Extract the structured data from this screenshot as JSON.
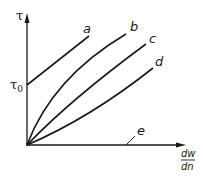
{
  "diagram": {
    "type": "flow-curve-diagram",
    "y_axis": {
      "label": "τ"
    },
    "x_axis": {
      "label_numerator": "dw",
      "label_denominator": "dn"
    },
    "y_intercept_label": {
      "main": "τ",
      "subscript": "0"
    },
    "curves": [
      {
        "id": "a",
        "label": "a",
        "shape": "straight line starting at τ0"
      },
      {
        "id": "b",
        "label": "b",
        "shape": "concave-down curve from origin"
      },
      {
        "id": "c",
        "label": "c",
        "shape": "straight line from origin"
      },
      {
        "id": "d",
        "label": "d",
        "shape": "concave-up curve from origin"
      },
      {
        "id": "e",
        "label": "e",
        "shape": "horizontal line along x-axis"
      }
    ],
    "colors": {
      "line": "#1a1a1a",
      "background": "#ffffff"
    }
  }
}
